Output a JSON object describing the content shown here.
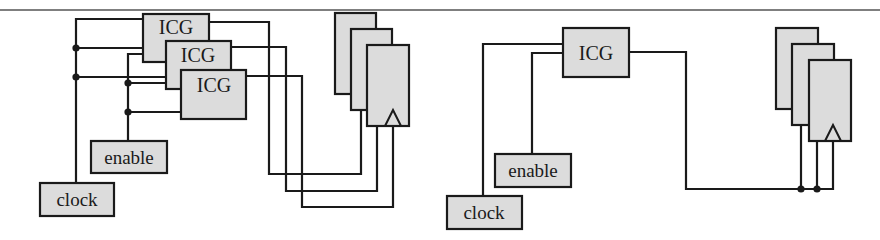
{
  "figure": {
    "left_panel": {
      "description": "One ICG per register (multiple clock gates)",
      "icg_cells": [
        {
          "label": "ICG"
        },
        {
          "label": "ICG"
        },
        {
          "label": "ICG"
        }
      ],
      "inputs": {
        "enable": {
          "label": "enable"
        },
        "clock": {
          "label": "clock"
        }
      },
      "flip_flops": 3
    },
    "right_panel": {
      "description": "Single shared ICG driving all registers",
      "icg_cells": [
        {
          "label": "ICG"
        }
      ],
      "inputs": {
        "enable": {
          "label": "enable"
        },
        "clock": {
          "label": "clock"
        }
      },
      "flip_flops": 3
    },
    "colors": {
      "box_fill": "#dcdcdc",
      "stroke": "#1a1a1a",
      "rule": "#555555",
      "background": "#ffffff"
    }
  }
}
